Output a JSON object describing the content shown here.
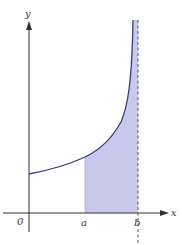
{
  "figure": {
    "axes": {
      "x_label": "x",
      "y_label": "y",
      "origin_label": "0"
    },
    "ticks": {
      "a_label": "a",
      "b_label": "b"
    },
    "colors": {
      "curve": "#3a3a8a",
      "shade": "#c9c9ec",
      "axis": "#333333",
      "asymptote": "#555555"
    }
  }
}
